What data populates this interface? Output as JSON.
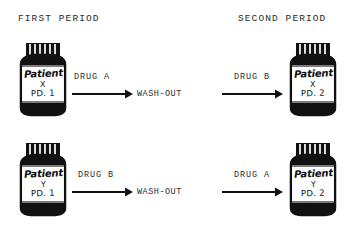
{
  "headers": {
    "first_period": "FIRST PERIOD",
    "second_period": "SECOND PERIOD"
  },
  "bottles": [
    {
      "id": "patient-x-period-1",
      "name": "Patient",
      "subject": "X",
      "period": "PD. 1"
    },
    {
      "id": "patient-x-period-2",
      "name": "Patient",
      "subject": "X",
      "period": "PD. 2"
    },
    {
      "id": "patient-y-period-1",
      "name": "Patient",
      "subject": "Y",
      "period": "PD. 1"
    },
    {
      "id": "patient-y-period-2",
      "name": "Patient",
      "subject": "Y",
      "period": "PD. 2"
    }
  ],
  "flow": {
    "top": {
      "drug_first": "DRUG A",
      "washout": "WASH-OUT",
      "drug_second": "DRUG B"
    },
    "bottom": {
      "drug_first": "DRUG B",
      "washout": "WASH-OUT",
      "drug_second": "DRUG A"
    }
  },
  "colors": {
    "ink": "#1a1a1a",
    "paper": "#ffffff",
    "cap": "#111111"
  }
}
